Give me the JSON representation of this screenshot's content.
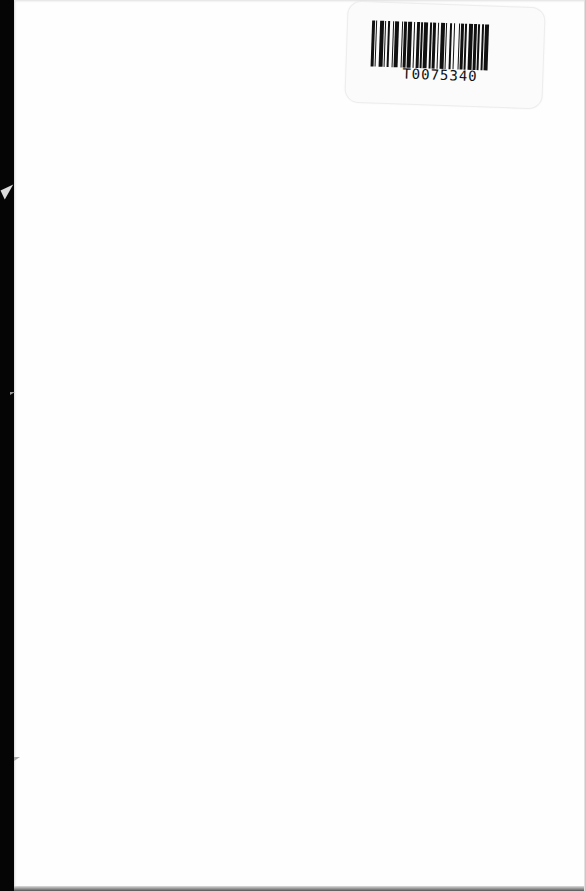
{
  "page": {
    "type": "blank scanned book page",
    "background_color": "#fefefe",
    "binding_edge_color": "#050505"
  },
  "barcode_label": {
    "number": "T0075340",
    "bars": [
      2,
      1,
      1,
      2,
      3,
      1,
      1,
      1,
      2,
      2,
      1,
      1,
      3,
      2,
      1,
      1,
      2,
      1,
      3,
      1,
      1,
      2,
      2,
      1,
      1,
      1,
      3,
      2,
      1,
      1,
      2,
      2,
      1,
      1,
      3,
      1,
      1,
      2,
      2,
      1,
      1,
      3,
      1,
      1,
      2,
      1,
      1,
      2,
      3,
      1,
      2,
      1,
      1,
      2,
      1,
      1,
      3,
      1
    ]
  }
}
